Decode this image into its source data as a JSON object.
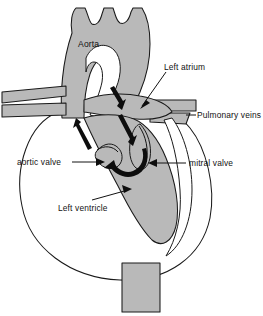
{
  "figure": {
    "background_color": "#ffffff",
    "line_color": "#1a1a1a",
    "fill_color": "#b9b9b9",
    "text_color": "#121212",
    "width": 263,
    "height": 316
  },
  "labels": {
    "aorta": "Aorta",
    "left_atrium": "Left atrium",
    "pulmonary_veins": "Pulmonary veins",
    "aortic_valve": "aortic valve",
    "mitral_valve": "mitral valve",
    "left_ventricle": "Left ventricle"
  },
  "structures": [
    {
      "name": "aortic-arch",
      "label": "Aorta",
      "fill": "#b9b9b9"
    },
    {
      "name": "brachiocephalic-branches",
      "label": "",
      "fill": "#b9b9b9"
    },
    {
      "name": "left-atrium",
      "label": "Left atrium",
      "fill": "#b9b9b9"
    },
    {
      "name": "pulmonary-veins",
      "label": "Pulmonary veins",
      "fill": "#b9b9b9"
    },
    {
      "name": "left-ventricle-cavity",
      "label": "Left ventricle",
      "fill": "#b9b9b9"
    },
    {
      "name": "aortic-valve",
      "label": "aortic valve",
      "fill": "#b9b9b9"
    },
    {
      "name": "mitral-valve",
      "label": "mitral valve",
      "fill": "#b9b9b9"
    },
    {
      "name": "descending-aorta",
      "label": "",
      "fill": "#b9b9b9"
    },
    {
      "name": "heart-outer-wall",
      "label": "",
      "fill": "#ffffff"
    }
  ],
  "flow_arrows": [
    {
      "name": "aortic-outflow-arrow-left",
      "direction": "up"
    },
    {
      "name": "atrial-inflow-arrow-right",
      "direction": "down"
    },
    {
      "name": "ventricular-outflow-curve-arrow",
      "direction": "curved-up"
    }
  ]
}
